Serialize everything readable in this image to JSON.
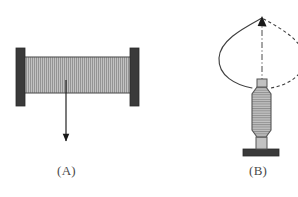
{
  "figure": {
    "background_color": "#ffffff",
    "panels": [
      {
        "id": "A",
        "caption": "(A)",
        "description": "Fixed-fixed hatched beam between two dark supports with a downward load arrow at midspan",
        "elements": {
          "left_support": {
            "name": "left-fixed-support",
            "color": "#3a3a3a",
            "x": 16,
            "y": 48,
            "width": 9,
            "height": 58
          },
          "right_support": {
            "name": "right-fixed-support",
            "color": "#3a3a3a",
            "x": 130,
            "y": 48,
            "width": 9,
            "height": 58
          },
          "beam": {
            "name": "hatched-beam",
            "fill": "#b8b8b8",
            "stroke": "#4a4a4a",
            "hatch": "vertical",
            "x": 20,
            "y": 57,
            "width": 115,
            "height": 36
          },
          "load_arrow": {
            "name": "downward-load-arrow",
            "color": "#1a1a1a",
            "x": 66,
            "y_start": 80,
            "y_end": 148
          }
        }
      },
      {
        "id": "B",
        "caption": "(B)",
        "description": "Vertical spindle on a base with a solid deflected curve on the left, a dash-dot centerline, and a dashed mirrored curve on the right, meeting at an arrow apex",
        "elements": {
          "base": {
            "name": "base-block",
            "color": "#3a3a3a",
            "x": 243,
            "y": 149,
            "width": 36,
            "height": 7
          },
          "stem": {
            "name": "stem",
            "fill": "#b8b8b8",
            "stroke": "#4a4a4a",
            "x": 256,
            "y": 138,
            "width": 10,
            "height": 11
          },
          "body": {
            "name": "hatched-spindle-body",
            "fill": "#b8b8b8",
            "stroke": "#4a4a4a",
            "hatch": "horizontal",
            "x": 252,
            "y": 86,
            "width": 19,
            "height": 52
          },
          "cap": {
            "name": "top-cap",
            "fill": "#b8b8b8",
            "stroke": "#4a4a4a",
            "x": 257,
            "y": 79,
            "width": 9,
            "height": 8
          },
          "solid_curve": {
            "name": "solid-deflection-curve",
            "color": "#3a3a3a",
            "style": "solid"
          },
          "dashed_curve": {
            "name": "dashed-deflection-curve",
            "color": "#3a3a3a",
            "style": "dashed"
          },
          "center_line": {
            "name": "dash-dot-centerline",
            "color": "#3a3a3a",
            "style": "dash-dot"
          },
          "apex_arrow": {
            "name": "apex-arrowhead",
            "color": "#1a1a1a",
            "x": 262,
            "y": 18
          }
        }
      }
    ]
  }
}
